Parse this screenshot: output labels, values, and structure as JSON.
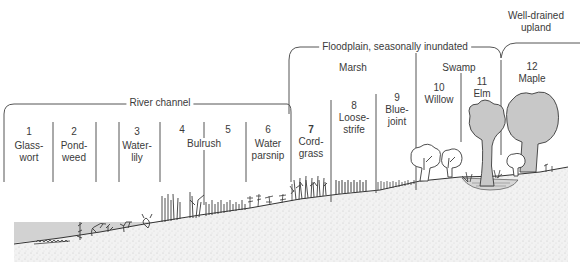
{
  "diagram": {
    "zones": [
      {
        "id": "river-channel",
        "label": "River channel"
      },
      {
        "id": "floodplain",
        "label": "Floodplain, seasonally inundated"
      },
      {
        "id": "upland",
        "label_line1": "Well-drained",
        "label_line2": "upland"
      }
    ],
    "subzones": [
      {
        "id": "marsh",
        "label": "Marsh"
      },
      {
        "id": "swamp",
        "label": "Swamp"
      }
    ],
    "plants": [
      {
        "num": "1",
        "line1": "Glass-",
        "line2": "wort"
      },
      {
        "num": "2",
        "line1": "Pond-",
        "line2": "weed"
      },
      {
        "num": "3",
        "line1": "Water-",
        "line2": "lily"
      },
      {
        "num": "4",
        "line1": "",
        "line2": ""
      },
      {
        "num": "5",
        "line1": "",
        "line2": ""
      },
      {
        "num": "6",
        "line1": "Water",
        "line2": "parsnip"
      },
      {
        "num": "7",
        "line1": "Cord-",
        "line2": "grass"
      },
      {
        "num": "8",
        "line1": "Loose-",
        "line2": "strife"
      },
      {
        "num": "9",
        "line1": "Blue-",
        "line2": "joint"
      },
      {
        "num": "10",
        "line1": "Willow",
        "line2": ""
      },
      {
        "num": "11",
        "line1": "Elm",
        "line2": ""
      },
      {
        "num": "12",
        "line1": "Maple",
        "line2": ""
      }
    ],
    "shared_labels": {
      "bulrush": "Bulrush"
    },
    "colors": {
      "line": "#555555",
      "water": "#d0d0d0",
      "tree_fill": "#c8c8c8",
      "soil": "#efefef",
      "plant": "#3a3a3a"
    }
  }
}
